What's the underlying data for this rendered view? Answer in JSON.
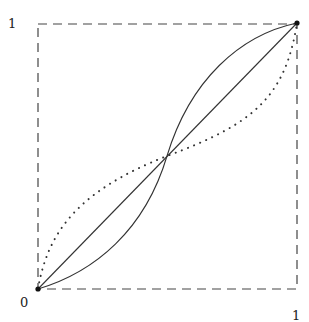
{
  "diagram": {
    "labels": {
      "y_top": "1",
      "origin": "0",
      "x_right": "1"
    },
    "frame": {
      "x0": 38,
      "y0": 289,
      "x1": 297,
      "y1": 23,
      "style": "dashed"
    },
    "points": [
      {
        "name": "origin",
        "x": 0,
        "y": 0
      },
      {
        "name": "top-right",
        "x": 1,
        "y": 1
      }
    ],
    "curves": [
      {
        "name": "diagonal",
        "style": "solid",
        "description": "straight line from (0,0) to (1,1)"
      },
      {
        "name": "s-curve",
        "style": "solid",
        "description": "below diagonal for x<0.5, above for x>0.5, crossing at (0.5,0.5)"
      },
      {
        "name": "inverse-s-curve",
        "style": "dotted",
        "description": "above diagonal for x<0.5, below for x>0.5, crossing at (0.5,0.5)"
      }
    ],
    "colors": {
      "stroke": "#333333",
      "dash": "#444444",
      "background": "#ffffff"
    }
  }
}
